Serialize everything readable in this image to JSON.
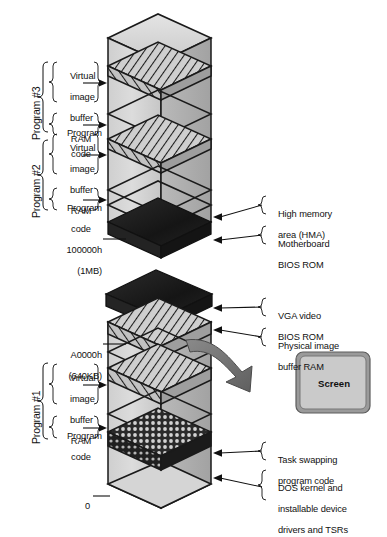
{
  "diagram": {
    "colors": {
      "outline": "#1a1a1a",
      "box_fill_light": "#d9d9d9",
      "box_fill_mid": "#c4c4c4",
      "box_fill_dark": "#ababab",
      "slab_black": "#1c1c1c",
      "slab_black_side": "#2e2e2e",
      "hatch_stroke": "#1a1a1a",
      "arrow_gray": "#7a7a7a",
      "arrow_gray_dark": "#5e5e5e",
      "screen_fill": "#c9c9c9",
      "screen_bezel": "#8e8e8e",
      "background": "#ffffff"
    }
  },
  "left_labels": {
    "program3": {
      "group": "Program #3",
      "items": [
        {
          "name": "virtual-image-buffer-ram",
          "lines": [
            "Virtual",
            "image",
            "buffer",
            "RAM"
          ]
        },
        {
          "name": "program-code",
          "lines": [
            "Program",
            "code"
          ]
        }
      ]
    },
    "program2": {
      "group": "Program #2",
      "items": [
        {
          "name": "virtual-image-buffer-ram",
          "lines": [
            "Virtual",
            "image",
            "buffer",
            "RAM"
          ]
        },
        {
          "name": "program-code",
          "lines": [
            "Program",
            "code"
          ]
        }
      ]
    },
    "program1": {
      "group": "Program #1",
      "items": [
        {
          "name": "virtual-image-buffer-ram",
          "lines": [
            "Virtual",
            "image",
            "buffer",
            "RAM"
          ]
        },
        {
          "name": "program-code",
          "lines": [
            "Program",
            "code"
          ]
        }
      ]
    }
  },
  "address_markers": [
    {
      "name": "addr-1mb",
      "line1": "100000h",
      "line2": "(1MB)"
    },
    {
      "name": "addr-640kb",
      "line1": "A0000h",
      "line2": "(640KB)"
    },
    {
      "name": "addr-zero",
      "line1": "0",
      "line2": ""
    }
  ],
  "right_labels": [
    {
      "name": "high-memory-area",
      "lines": [
        "High memory",
        "area (HMA)"
      ]
    },
    {
      "name": "motherboard-bios-rom",
      "lines": [
        "Motherboard",
        "BIOS ROM"
      ]
    },
    {
      "name": "vga-video-bios-rom",
      "lines": [
        "VGA video",
        "BIOS ROM"
      ]
    },
    {
      "name": "physical-image-buffer-ram",
      "lines": [
        "Physical image",
        "buffer RAM"
      ]
    },
    {
      "name": "task-swapping-program-code",
      "lines": [
        "Task swapping",
        "program code"
      ]
    },
    {
      "name": "dos-kernel-drivers",
      "lines": [
        "DOS kernel and",
        "installable device",
        "drivers and TSRs"
      ]
    }
  ],
  "screen": {
    "label": "Screen"
  }
}
